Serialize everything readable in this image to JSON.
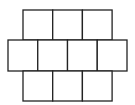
{
  "diagram": {
    "type": "grid-net",
    "stroke_color": "#222222",
    "fill_color": "#ffffff",
    "rows": [
      {
        "name": "top-row",
        "cells": 3,
        "x": 23,
        "y": 10,
        "cell_w": 29.7,
        "cell_h": 30
      },
      {
        "name": "middle-row",
        "cells": 4,
        "x": 8,
        "y": 40,
        "cell_w": 29.75,
        "cell_h": 31
      },
      {
        "name": "bottom-row",
        "cells": 3,
        "x": 23,
        "y": 71,
        "cell_w": 29.7,
        "cell_h": 30
      }
    ],
    "total_cells": 10
  }
}
